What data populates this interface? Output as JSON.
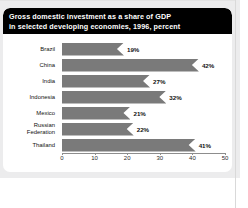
{
  "figure": {
    "title_lines": [
      "Gross domestic investment as a share of GDP",
      "in selected developing economies, 1996, percent"
    ],
    "bar_color": "#7a7a7a",
    "title_bg": "#000000",
    "title_fg": "#ffffff",
    "page_bg": "#ececed",
    "panel_bg": "#ffffff"
  },
  "chart_data": {
    "type": "bar",
    "orientation": "horizontal",
    "title": "Gross domestic investment as a share of GDP in selected developing economies, 1996, percent",
    "xlabel": "",
    "ylabel": "",
    "xlim": [
      0,
      50
    ],
    "xticks": [
      0,
      10,
      20,
      30,
      40,
      50
    ],
    "xtick_labels": [
      "0",
      "10",
      "20",
      "30",
      "40",
      "50"
    ],
    "grid": false,
    "legend": false,
    "value_suffix": "%",
    "categories": [
      "Brazil",
      "China",
      "India",
      "Indonesia",
      "Mexico",
      "Russian Federation",
      "Thailand"
    ],
    "values": [
      19,
      42,
      27,
      32,
      21,
      22,
      41
    ],
    "data_labels": [
      "19%",
      "42%",
      "27%",
      "32%",
      "21%",
      "22%",
      "41%"
    ],
    "category_label_lines": [
      [
        "Brazil"
      ],
      [
        "China"
      ],
      [
        "India"
      ],
      [
        "Indonesia"
      ],
      [
        "Mexico"
      ],
      [
        "Russian",
        "Federation"
      ],
      [
        "Thailand"
      ]
    ]
  }
}
